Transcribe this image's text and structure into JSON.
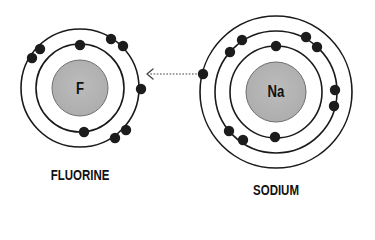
{
  "diagram": {
    "colors": {
      "nucleus_fill": "#b4b4b4",
      "nucleus_stroke": "#6e6e6e",
      "shell_stroke": "#1a1a1a",
      "electron_fill": "#1c1c1c",
      "arrow_stroke": "#444444",
      "label_color": "#111111"
    },
    "arrow": {
      "direction": "sodium-to-fluorine",
      "style": "dotted",
      "from": [
        200,
        74
      ],
      "to": [
        147,
        74
      ]
    },
    "atoms": [
      {
        "id": "fluorine",
        "name": "FLUORINE",
        "symbol": "F",
        "center": [
          80,
          88
        ],
        "nucleus_radius": 28,
        "shells": [
          {
            "radius": 44,
            "electron_count": 2,
            "electrons": [
              [
                80,
                45
              ],
              [
                84,
                132
              ]
            ]
          },
          {
            "radius": 59,
            "electron_count": 7,
            "electrons": [
              [
                40,
                49
              ],
              [
                32,
                58
              ],
              [
                111,
                39
              ],
              [
                123,
                46
              ],
              [
                141,
                89
              ],
              [
                126,
                130
              ],
              [
                115,
                138
              ]
            ]
          }
        ]
      },
      {
        "id": "sodium",
        "name": "SODIUM",
        "symbol": "Na",
        "center": [
          276,
          92
        ],
        "nucleus_radius": 30,
        "shells": [
          {
            "radius": 46,
            "electron_count": 2,
            "electrons": [
              [
                276,
                46
              ],
              [
                275,
                137
              ]
            ]
          },
          {
            "radius": 61,
            "electron_count": 8,
            "electrons": [
              [
                242,
                40
              ],
              [
                230,
                52
              ],
              [
                306,
                37
              ],
              [
                317,
                47
              ],
              [
                335,
                90
              ],
              [
                334,
                106
              ],
              [
                229,
                131
              ],
              [
                243,
                140
              ]
            ]
          },
          {
            "radius": 76,
            "electron_count": 1,
            "electrons": [
              [
                203,
                74
              ]
            ]
          }
        ]
      }
    ]
  }
}
